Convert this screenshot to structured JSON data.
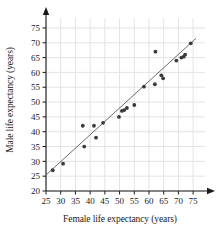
{
  "chart_data": {
    "type": "scatter",
    "title": "",
    "xlabel": "Female life expectancy (years)",
    "ylabel": "Male life expectancy (years)",
    "xlim": [
      25,
      77
    ],
    "ylim": [
      20,
      77
    ],
    "xticks": [
      25,
      30,
      35,
      40,
      45,
      50,
      55,
      60,
      65,
      70,
      75
    ],
    "yticks": [
      20,
      25,
      30,
      35,
      40,
      45,
      50,
      55,
      60,
      65,
      70,
      75
    ],
    "grid": true,
    "legend": null,
    "axis_arrows": true,
    "point_color": "#3a3a3a",
    "line_color": "#5a5a5a",
    "grid_color": "#e3e3e3",
    "background": "#ffffff",
    "points": [
      {
        "x": 27.3,
        "y": 27.0
      },
      {
        "x": 30.8,
        "y": 29.2
      },
      {
        "x": 37.5,
        "y": 42.0
      },
      {
        "x": 38.0,
        "y": 35.0
      },
      {
        "x": 41.3,
        "y": 42.0
      },
      {
        "x": 42.0,
        "y": 38.0
      },
      {
        "x": 44.4,
        "y": 43.0
      },
      {
        "x": 49.8,
        "y": 45.0
      },
      {
        "x": 50.8,
        "y": 47.0
      },
      {
        "x": 51.6,
        "y": 47.3
      },
      {
        "x": 52.5,
        "y": 48.0
      },
      {
        "x": 55.0,
        "y": 49.0
      },
      {
        "x": 58.3,
        "y": 55.2
      },
      {
        "x": 62.0,
        "y": 56.0
      },
      {
        "x": 62.2,
        "y": 67.0
      },
      {
        "x": 64.2,
        "y": 59.0
      },
      {
        "x": 64.8,
        "y": 58.0
      },
      {
        "x": 69.3,
        "y": 64.0
      },
      {
        "x": 71.0,
        "y": 65.0
      },
      {
        "x": 71.8,
        "y": 65.3
      },
      {
        "x": 72.3,
        "y": 66.0
      },
      {
        "x": 74.2,
        "y": 69.8
      }
    ],
    "trend_line": {
      "label": "least-squares line",
      "x1": 25.0,
      "y1": 25.4,
      "x2": 76.0,
      "y2": 71.5
    }
  }
}
